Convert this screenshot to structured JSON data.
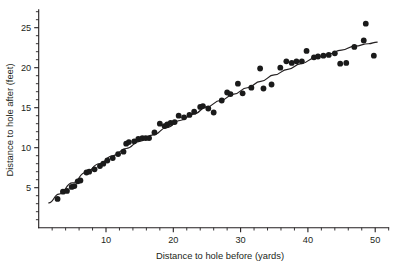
{
  "chart_data": {
    "type": "scatter",
    "title": "",
    "xlabel": "Distance to hole before (yards)",
    "ylabel": "Distance to hole after (feet)",
    "xlim": [
      0,
      52
    ],
    "ylim": [
      0,
      27
    ],
    "xticks": [
      10,
      20,
      30,
      40,
      50
    ],
    "yticks": [
      5,
      10,
      15,
      20,
      25
    ],
    "x_minor_step": 2,
    "y_minor_step": 1,
    "grid": false,
    "legend": "none",
    "point_color": "#1a1a1a",
    "line_color": "#231f20",
    "series": [
      {
        "name": "Putts",
        "type": "scatter",
        "points": [
          [
            2.8,
            3.6
          ],
          [
            3.6,
            4.5
          ],
          [
            4.2,
            4.6
          ],
          [
            4.9,
            5.1
          ],
          [
            5.3,
            5.2
          ],
          [
            5.8,
            5.8
          ],
          [
            6.2,
            5.9
          ],
          [
            7.1,
            6.9
          ],
          [
            7.5,
            7.0
          ],
          [
            8.3,
            7.3
          ],
          [
            9.1,
            7.7
          ],
          [
            9.6,
            8.0
          ],
          [
            10.2,
            8.4
          ],
          [
            11.0,
            8.7
          ],
          [
            11.8,
            9.2
          ],
          [
            12.6,
            9.5
          ],
          [
            13.0,
            10.5
          ],
          [
            13.4,
            10.7
          ],
          [
            14.2,
            10.8
          ],
          [
            14.8,
            11.1
          ],
          [
            15.4,
            11.2
          ],
          [
            15.9,
            11.2
          ],
          [
            16.4,
            11.2
          ],
          [
            17.2,
            11.9
          ],
          [
            18.0,
            13.0
          ],
          [
            18.7,
            12.7
          ],
          [
            19.1,
            12.9
          ],
          [
            19.6,
            13.1
          ],
          [
            20.2,
            13.2
          ],
          [
            20.8,
            14.0
          ],
          [
            21.6,
            13.8
          ],
          [
            22.4,
            14.1
          ],
          [
            23.1,
            14.5
          ],
          [
            24.0,
            15.1
          ],
          [
            24.4,
            15.2
          ],
          [
            25.2,
            14.9
          ],
          [
            26.0,
            14.4
          ],
          [
            27.2,
            15.9
          ],
          [
            28.0,
            16.9
          ],
          [
            28.5,
            16.7
          ],
          [
            29.6,
            18.0
          ],
          [
            30.3,
            16.8
          ],
          [
            31.6,
            17.5
          ],
          [
            32.9,
            19.9
          ],
          [
            33.4,
            17.4
          ],
          [
            34.6,
            17.9
          ],
          [
            35.9,
            20.0
          ],
          [
            36.8,
            20.8
          ],
          [
            37.6,
            20.6
          ],
          [
            38.3,
            20.8
          ],
          [
            39.1,
            20.8
          ],
          [
            39.8,
            22.1
          ],
          [
            40.9,
            21.3
          ],
          [
            41.5,
            21.4
          ],
          [
            42.3,
            21.5
          ],
          [
            43.1,
            21.6
          ],
          [
            44.0,
            21.8
          ],
          [
            44.8,
            20.5
          ],
          [
            45.7,
            20.6
          ],
          [
            46.9,
            22.6
          ],
          [
            48.3,
            23.4
          ],
          [
            48.6,
            25.5
          ],
          [
            49.8,
            21.5
          ]
        ]
      },
      {
        "name": "Fitted curve",
        "type": "line",
        "points": [
          [
            1.5,
            3.1
          ],
          [
            3.0,
            4.2
          ],
          [
            5.0,
            5.6
          ],
          [
            7.0,
            6.9
          ],
          [
            9.0,
            8.0
          ],
          [
            11.0,
            9.0
          ],
          [
            13.0,
            9.9
          ],
          [
            15.0,
            10.8
          ],
          [
            17.0,
            11.6
          ],
          [
            19.0,
            12.5
          ],
          [
            21.0,
            13.4
          ],
          [
            23.0,
            14.2
          ],
          [
            25.0,
            15.1
          ],
          [
            27.0,
            15.9
          ],
          [
            29.0,
            16.7
          ],
          [
            31.0,
            17.5
          ],
          [
            33.0,
            18.3
          ],
          [
            35.0,
            19.1
          ],
          [
            37.0,
            19.8
          ],
          [
            39.0,
            20.5
          ],
          [
            41.0,
            21.2
          ],
          [
            43.0,
            21.7
          ],
          [
            45.0,
            22.2
          ],
          [
            47.0,
            22.7
          ],
          [
            49.0,
            23.0
          ],
          [
            50.3,
            23.2
          ]
        ]
      }
    ]
  }
}
